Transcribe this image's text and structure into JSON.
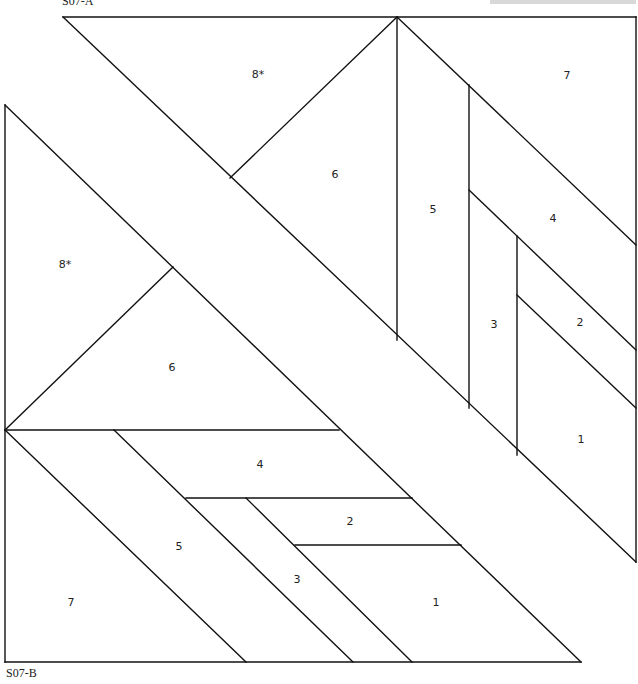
{
  "labels": {
    "top_block": "S07-A",
    "bottom_block": "S07-B"
  },
  "colors": {
    "line": "#111111",
    "background": "#ffffff",
    "header_bar": "#d9d9d9"
  },
  "block_a": {
    "pieces": [
      {
        "id": "8*",
        "x": 258,
        "y": 75
      },
      {
        "id": "7",
        "x": 567,
        "y": 76
      },
      {
        "id": "6",
        "x": 335,
        "y": 175
      },
      {
        "id": "5",
        "x": 433,
        "y": 210
      },
      {
        "id": "4",
        "x": 553,
        "y": 219
      },
      {
        "id": "3",
        "x": 494,
        "y": 325
      },
      {
        "id": "2",
        "x": 580,
        "y": 323
      },
      {
        "id": "1",
        "x": 581,
        "y": 440
      }
    ]
  },
  "block_b": {
    "pieces": [
      {
        "id": "8*",
        "x": 65,
        "y": 265
      },
      {
        "id": "6",
        "x": 172,
        "y": 368
      },
      {
        "id": "4",
        "x": 260,
        "y": 465
      },
      {
        "id": "2",
        "x": 350,
        "y": 522
      },
      {
        "id": "5",
        "x": 179,
        "y": 547
      },
      {
        "id": "3",
        "x": 297,
        "y": 580
      },
      {
        "id": "7",
        "x": 71,
        "y": 603
      },
      {
        "id": "1",
        "x": 436,
        "y": 603
      }
    ]
  }
}
